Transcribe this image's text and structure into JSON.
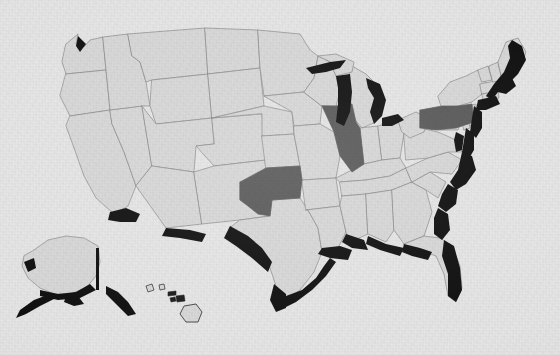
{
  "figure": {
    "kind": "choropleth-map",
    "width": 560,
    "height": 355,
    "has_labels": false,
    "has_legend": false,
    "has_title": false,
    "projection_note": "contiguous US with Alaska and Hawaii insets at lower left"
  },
  "palette": {
    "background": "#e6e6e6",
    "paper_tint": "#e3e3e3",
    "state_default_fill": "#d8d8d8",
    "state_highlight_fill": "#5a5a5a",
    "coast_shading": "#101010",
    "border_stroke": "#8a8a8a",
    "outer_border_stroke": "#6f6f6f"
  },
  "map_data": {
    "type": "choropleth",
    "value_classes": [
      {
        "name": "highlighted",
        "fill": "#5a5a5a"
      },
      {
        "name": "default",
        "fill": "#d8d8d8"
      }
    ],
    "highlighted_states": [
      "Illinois",
      "Pennsylvania",
      "Oklahoma"
    ],
    "insets": [
      "Alaska",
      "Hawaii"
    ],
    "coastline_shading": "heavy black band along Atlantic coast, Gulf coast, Great Lakes, Pacific Northwest and southern border",
    "states": [
      {
        "name": "Washington",
        "abbr": "WA",
        "fill_class": "default"
      },
      {
        "name": "Oregon",
        "abbr": "OR",
        "fill_class": "default"
      },
      {
        "name": "California",
        "abbr": "CA",
        "fill_class": "default"
      },
      {
        "name": "Nevada",
        "abbr": "NV",
        "fill_class": "default"
      },
      {
        "name": "Idaho",
        "abbr": "ID",
        "fill_class": "default"
      },
      {
        "name": "Montana",
        "abbr": "MT",
        "fill_class": "default"
      },
      {
        "name": "Wyoming",
        "abbr": "WY",
        "fill_class": "default"
      },
      {
        "name": "Utah",
        "abbr": "UT",
        "fill_class": "default"
      },
      {
        "name": "Arizona",
        "abbr": "AZ",
        "fill_class": "default"
      },
      {
        "name": "Colorado",
        "abbr": "CO",
        "fill_class": "default"
      },
      {
        "name": "New Mexico",
        "abbr": "NM",
        "fill_class": "default"
      },
      {
        "name": "North Dakota",
        "abbr": "ND",
        "fill_class": "default"
      },
      {
        "name": "South Dakota",
        "abbr": "SD",
        "fill_class": "default"
      },
      {
        "name": "Nebraska",
        "abbr": "NE",
        "fill_class": "default"
      },
      {
        "name": "Kansas",
        "abbr": "KS",
        "fill_class": "default"
      },
      {
        "name": "Oklahoma",
        "abbr": "OK",
        "fill_class": "highlighted"
      },
      {
        "name": "Texas",
        "abbr": "TX",
        "fill_class": "default"
      },
      {
        "name": "Minnesota",
        "abbr": "MN",
        "fill_class": "default"
      },
      {
        "name": "Iowa",
        "abbr": "IA",
        "fill_class": "default"
      },
      {
        "name": "Missouri",
        "abbr": "MO",
        "fill_class": "default"
      },
      {
        "name": "Arkansas",
        "abbr": "AR",
        "fill_class": "default"
      },
      {
        "name": "Louisiana",
        "abbr": "LA",
        "fill_class": "default"
      },
      {
        "name": "Wisconsin",
        "abbr": "WI",
        "fill_class": "default"
      },
      {
        "name": "Illinois",
        "abbr": "IL",
        "fill_class": "highlighted"
      },
      {
        "name": "Michigan",
        "abbr": "MI",
        "fill_class": "default"
      },
      {
        "name": "Indiana",
        "abbr": "IN",
        "fill_class": "default"
      },
      {
        "name": "Ohio",
        "abbr": "OH",
        "fill_class": "default"
      },
      {
        "name": "Kentucky",
        "abbr": "KY",
        "fill_class": "default"
      },
      {
        "name": "Tennessee",
        "abbr": "TN",
        "fill_class": "default"
      },
      {
        "name": "Mississippi",
        "abbr": "MS",
        "fill_class": "default"
      },
      {
        "name": "Alabama",
        "abbr": "AL",
        "fill_class": "default"
      },
      {
        "name": "Georgia",
        "abbr": "GA",
        "fill_class": "default"
      },
      {
        "name": "Florida",
        "abbr": "FL",
        "fill_class": "default"
      },
      {
        "name": "South Carolina",
        "abbr": "SC",
        "fill_class": "default"
      },
      {
        "name": "North Carolina",
        "abbr": "NC",
        "fill_class": "default"
      },
      {
        "name": "Virginia",
        "abbr": "VA",
        "fill_class": "default"
      },
      {
        "name": "West Virginia",
        "abbr": "WV",
        "fill_class": "default"
      },
      {
        "name": "Maryland",
        "abbr": "MD",
        "fill_class": "default"
      },
      {
        "name": "Delaware",
        "abbr": "DE",
        "fill_class": "default"
      },
      {
        "name": "Pennsylvania",
        "abbr": "PA",
        "fill_class": "highlighted"
      },
      {
        "name": "New Jersey",
        "abbr": "NJ",
        "fill_class": "default"
      },
      {
        "name": "New York",
        "abbr": "NY",
        "fill_class": "default"
      },
      {
        "name": "Connecticut",
        "abbr": "CT",
        "fill_class": "default"
      },
      {
        "name": "Rhode Island",
        "abbr": "RI",
        "fill_class": "default"
      },
      {
        "name": "Massachusetts",
        "abbr": "MA",
        "fill_class": "default"
      },
      {
        "name": "Vermont",
        "abbr": "VT",
        "fill_class": "default"
      },
      {
        "name": "New Hampshire",
        "abbr": "NH",
        "fill_class": "default"
      },
      {
        "name": "Maine",
        "abbr": "ME",
        "fill_class": "default"
      },
      {
        "name": "Alaska",
        "abbr": "AK",
        "fill_class": "default"
      },
      {
        "name": "Hawaii",
        "abbr": "HI",
        "fill_class": "default"
      }
    ]
  }
}
